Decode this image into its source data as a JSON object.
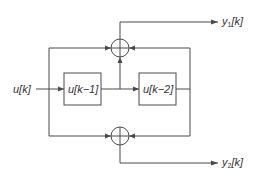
{
  "diagram": {
    "type": "block-diagram",
    "input": {
      "label": "u[k]"
    },
    "blocks": [
      {
        "id": "delay1",
        "label": "u[k−1]"
      },
      {
        "id": "delay2",
        "label": "u[k−2]"
      }
    ],
    "summing_junctions": [
      {
        "id": "sum-top",
        "symbol": "+"
      },
      {
        "id": "sum-bottom",
        "symbol": "+"
      }
    ],
    "outputs": [
      {
        "id": "y1",
        "base": "y",
        "sub": "1",
        "suffix": "[k]"
      },
      {
        "id": "y2",
        "base": "y",
        "sub": "2",
        "suffix": "[k]"
      }
    ],
    "colors": {
      "line": "#4a4a4a",
      "text": "#333333",
      "background": "#ffffff"
    }
  }
}
